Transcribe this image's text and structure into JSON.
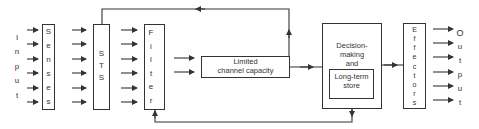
{
  "diagram": {
    "input": {
      "label": "Input",
      "letters": [
        "I",
        "n",
        "p",
        "u",
        "t"
      ]
    },
    "senses": {
      "label": "Senses",
      "letters": [
        "S",
        "e",
        "n",
        "s",
        "e",
        "s"
      ]
    },
    "sts": {
      "label": "STS",
      "letters": [
        "S",
        "T",
        "S"
      ]
    },
    "filter": {
      "label": "Filter",
      "letters": [
        "F",
        "i",
        "l",
        "t",
        "e",
        "r"
      ]
    },
    "limited_channel": {
      "line1": "Limited",
      "line2": "channel capacity"
    },
    "decision": {
      "line1": "Decision-",
      "line2": "making",
      "line3": "and"
    },
    "long_term_store": {
      "line1": "Long-term",
      "line2": "store"
    },
    "effectors": {
      "label": "Effectors",
      "letters": [
        "E",
        "f",
        "f",
        "e",
        "c",
        "t",
        "o",
        "r",
        "s"
      ]
    },
    "output": {
      "label": "Output",
      "letters": [
        "O",
        "u",
        "t",
        "p",
        "u",
        "t"
      ]
    },
    "line_color": "#333333"
  }
}
